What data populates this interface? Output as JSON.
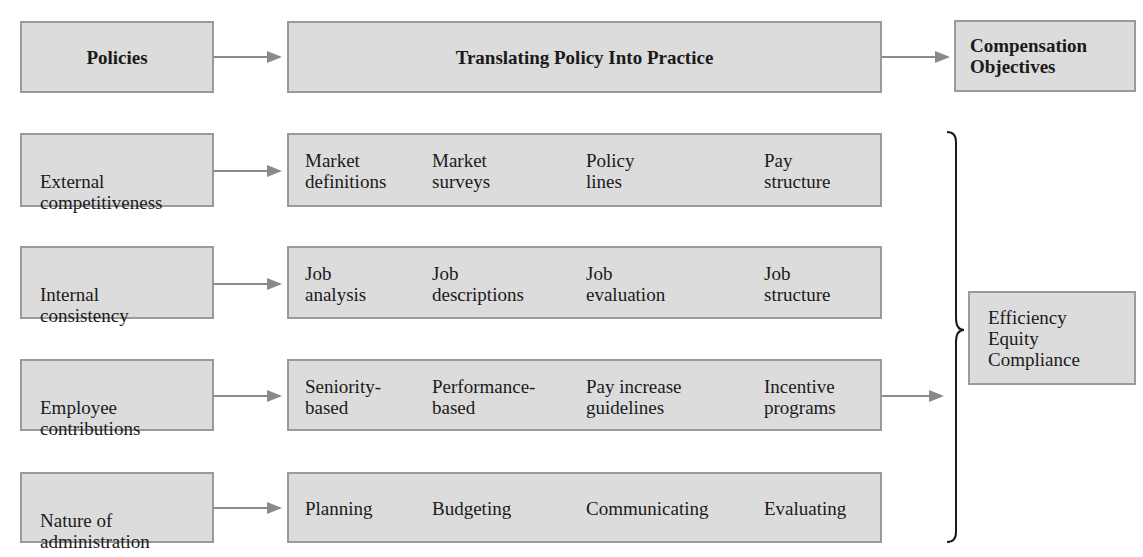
{
  "header": {
    "policies": "Policies",
    "translating": "Translating Policy Into Practice",
    "objectives": "Compensation\nObjectives"
  },
  "rows": [
    {
      "policy": "External\ncompetitiveness",
      "practices": [
        "Market\ndefinitions",
        "Market\nsurveys",
        "Policy\nlines",
        "Pay\nstructure"
      ]
    },
    {
      "policy": "Internal\nconsistency",
      "practices": [
        "Job\nanalysis",
        "Job\ndescriptions",
        "Job\nevaluation",
        "Job\nstructure"
      ]
    },
    {
      "policy": "Employee\ncontributions",
      "practices": [
        "Seniority-\nbased",
        "Performance-\nbased",
        "Pay increase\nguidelines",
        "Incentive\nprograms"
      ]
    },
    {
      "policy": "Nature of\nadministration",
      "practices": [
        "Planning",
        "Budgeting",
        "Communicating",
        "Evaluating"
      ]
    }
  ],
  "objectives_box": "Efficiency\nEquity\nCompliance",
  "colors": {
    "box_fill": "#dcdcdc",
    "box_border": "#9a9a9a",
    "arrow": "#8a8a8a",
    "brace": "#1a1a1a"
  }
}
